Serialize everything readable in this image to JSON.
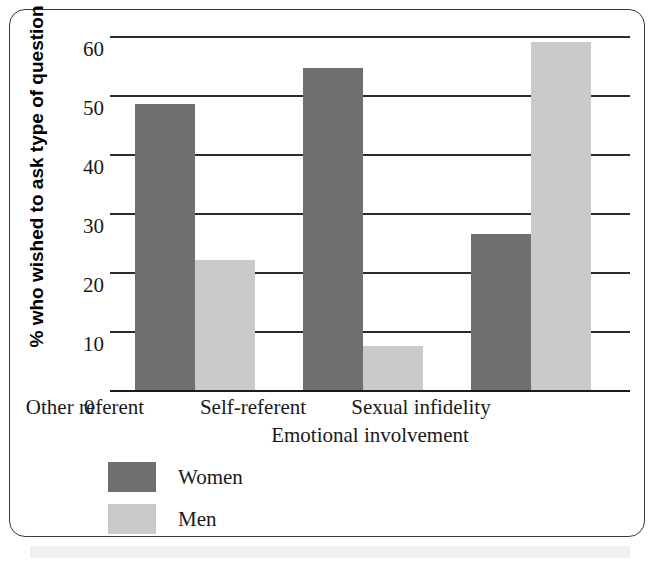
{
  "chart_data": {
    "type": "bar",
    "title": "",
    "xlabel": "Emotional involvement",
    "ylabel": "% who wished to ask type of question",
    "categories": [
      "Other referent",
      "Self-referent",
      "Sexual infidelity"
    ],
    "series": [
      {
        "name": "Women",
        "color": "#6f6f6f",
        "values": [
          48.5,
          54.5,
          26.5
        ]
      },
      {
        "name": "Men",
        "color": "#cacaca",
        "values": [
          22,
          7.5,
          59
        ]
      }
    ],
    "ylim": [
      0,
      60
    ],
    "yticks": [
      0,
      10,
      20,
      30,
      40,
      50,
      60
    ],
    "ytick_labels": [
      "0",
      "10",
      "20",
      "30",
      "40",
      "50",
      "60"
    ],
    "grid": true,
    "grid_axis": "y",
    "legend_position": "below-left",
    "xtick_zero_label": "0"
  },
  "legend": {
    "entries": [
      {
        "label": "Women"
      },
      {
        "label": "Men"
      }
    ]
  },
  "colors": {
    "women": "#6f6f6f",
    "men": "#cacaca",
    "grid": "#2b2b2b",
    "frame": "#3a3a3a",
    "text": "#1a1a1a"
  }
}
